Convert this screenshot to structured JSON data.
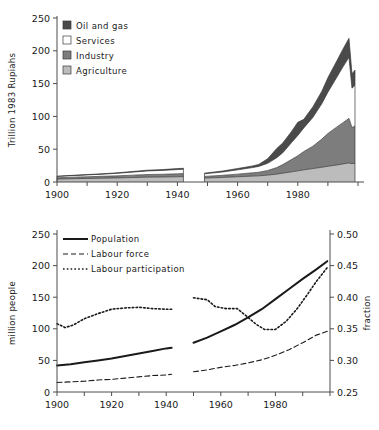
{
  "figure": {
    "width": 379,
    "height": 430,
    "background": "#ffffff"
  },
  "chart_data": [
    {
      "id": "gdp-by-sector",
      "type": "area",
      "stacked": true,
      "title": "",
      "xlabel": "",
      "ylabel": "Trillion 1983 Rupiahs",
      "xlim": [
        1900,
        2000
      ],
      "ylim": [
        0,
        250
      ],
      "xticks": [
        1900,
        1910,
        1920,
        1930,
        1940,
        1950,
        1960,
        1970,
        1980,
        1990,
        2000
      ],
      "xtick_labels": [
        "1900",
        "",
        "1920",
        "",
        "1940",
        "",
        "1960",
        "",
        "1980",
        "",
        ""
      ],
      "yticks": [
        0,
        50,
        100,
        150,
        200,
        250
      ],
      "ytick_labels": [
        "0",
        "50",
        "100",
        "150",
        "200",
        "250"
      ],
      "grid": false,
      "legend_position": "top-left",
      "data_gap": [
        1942,
        1949
      ],
      "colors": {
        "oil_and_gas": "#4a4a4a",
        "services": "#ffffff",
        "industry": "#7d7d7d",
        "agriculture": "#bcbcbc",
        "outline": "#3a3a3a"
      },
      "legend": [
        {
          "label": "Oil and gas",
          "color": "#4a4a4a"
        },
        {
          "label": "Services",
          "color": "#ffffff"
        },
        {
          "label": "Industry",
          "color": "#7d7d7d"
        },
        {
          "label": "Agriculture",
          "color": "#bcbcbc"
        }
      ],
      "x": [
        1900,
        1905,
        1910,
        1915,
        1920,
        1925,
        1930,
        1935,
        1940,
        1942,
        1949,
        1955,
        1960,
        1965,
        1967,
        1970,
        1973,
        1975,
        1978,
        1980,
        1982,
        1985,
        1988,
        1990,
        1993,
        1995,
        1997,
        1998,
        1999
      ],
      "series": [
        {
          "name": "Agriculture",
          "values": [
            4.5,
            5.0,
            5.4,
            5.8,
            6.2,
            6.8,
            7.4,
            7.6,
            8.0,
            8.2,
            6.0,
            7.0,
            8.0,
            9.0,
            9.4,
            10.5,
            12.0,
            13.5,
            15.5,
            17.0,
            18.5,
            20.5,
            22.5,
            24.0,
            26.0,
            27.5,
            29.0,
            28.0,
            28.5
          ]
        },
        {
          "name": "Industry",
          "values": [
            2.0,
            2.3,
            2.6,
            2.9,
            3.2,
            3.6,
            4.0,
            4.2,
            4.5,
            4.6,
            2.5,
            3.2,
            4.0,
            5.0,
            5.5,
            7.0,
            10.0,
            13.0,
            19.0,
            23.0,
            28.0,
            34.0,
            43.0,
            50.0,
            58.0,
            63.0,
            68.0,
            55.0,
            57.0
          ]
        },
        {
          "name": "Services",
          "values": [
            2.0,
            2.4,
            2.8,
            3.2,
            3.8,
            4.6,
            5.4,
            5.8,
            6.4,
            6.6,
            4.0,
            5.0,
            6.5,
            8.0,
            8.8,
            11.0,
            15.0,
            18.0,
            26.0,
            31.0,
            36.0,
            44.0,
            54.0,
            63.0,
            76.0,
            85.0,
            93.0,
            60.0,
            62.0
          ]
        },
        {
          "name": "Oil and gas",
          "values": [
            0.3,
            0.4,
            0.5,
            0.6,
            0.8,
            1.0,
            1.2,
            1.3,
            1.5,
            1.5,
            1.0,
            1.5,
            2.0,
            2.5,
            3.0,
            7.0,
            14.0,
            15.0,
            17.0,
            20.0,
            13.0,
            16.0,
            19.0,
            22.0,
            25.0,
            27.0,
            29.0,
            22.0,
            23.0
          ]
        }
      ]
    },
    {
      "id": "population-and-labour",
      "type": "line",
      "title": "",
      "xlabel": "",
      "ylabel": "million people",
      "y2label": "fraction",
      "xlim": [
        1900,
        2000
      ],
      "ylim": [
        0,
        250
      ],
      "y2lim": [
        0.25,
        0.5
      ],
      "xticks": [
        1900,
        1910,
        1920,
        1930,
        1940,
        1950,
        1960,
        1970,
        1980,
        1990,
        2000
      ],
      "xtick_labels": [
        "1900",
        "",
        "1920",
        "",
        "1940",
        "",
        "1960",
        "",
        "1980",
        "",
        ""
      ],
      "yticks": [
        0,
        50,
        100,
        150,
        200,
        250
      ],
      "ytick_labels": [
        "0",
        "50",
        "100",
        "150",
        "200",
        "250"
      ],
      "y2ticks": [
        0.25,
        0.3,
        0.35,
        0.4,
        0.45,
        0.5
      ],
      "y2tick_labels": [
        "0.25",
        "0.30",
        "0.35",
        "0.40",
        "0.45",
        "0.50"
      ],
      "grid": false,
      "legend_position": "top-left",
      "data_gap": [
        1942,
        1950
      ],
      "legend": [
        {
          "label": "Population",
          "style": "solid"
        },
        {
          "label": "Labour force",
          "style": "dashed"
        },
        {
          "label": "Labour participation",
          "style": "dotted"
        }
      ],
      "series": [
        {
          "name": "Population",
          "axis": "left",
          "style": "solid",
          "x": [
            1900,
            1905,
            1910,
            1915,
            1920,
            1925,
            1930,
            1935,
            1940,
            1942
          ],
          "values": [
            42,
            44,
            47,
            50,
            53,
            57,
            61,
            65,
            69,
            70
          ],
          "x2": [
            1950,
            1955,
            1960,
            1965,
            1970,
            1975,
            1980,
            1985,
            1990,
            1995,
            1999
          ],
          "values2": [
            78,
            86,
            96,
            106,
            118,
            131,
            147,
            163,
            179,
            194,
            207
          ]
        },
        {
          "name": "Labour force",
          "axis": "left",
          "style": "dashed",
          "x": [
            1900,
            1905,
            1910,
            1915,
            1920,
            1925,
            1930,
            1935,
            1940,
            1942
          ],
          "values": [
            15,
            16,
            17,
            19,
            20,
            22,
            24,
            26,
            27,
            28
          ],
          "x2": [
            1950,
            1955,
            1960,
            1965,
            1970,
            1975,
            1980,
            1985,
            1990,
            1995,
            1999
          ],
          "values2": [
            32,
            35,
            39,
            42,
            46,
            51,
            58,
            67,
            78,
            90,
            96
          ]
        },
        {
          "name": "Labour participation",
          "axis": "right",
          "style": "dotted",
          "x": [
            1900,
            1903,
            1906,
            1910,
            1915,
            1920,
            1925,
            1930,
            1935,
            1940,
            1942
          ],
          "values": [
            0.358,
            0.352,
            0.356,
            0.366,
            0.374,
            0.381,
            0.383,
            0.384,
            0.382,
            0.381,
            0.381
          ],
          "x2": [
            1950,
            1955,
            1958,
            1962,
            1966,
            1970,
            1973,
            1976,
            1980,
            1984,
            1988,
            1992,
            1995,
            1999
          ],
          "values2": [
            0.399,
            0.396,
            0.385,
            0.382,
            0.382,
            0.368,
            0.357,
            0.349,
            0.349,
            0.362,
            0.382,
            0.406,
            0.425,
            0.447
          ]
        }
      ]
    }
  ]
}
